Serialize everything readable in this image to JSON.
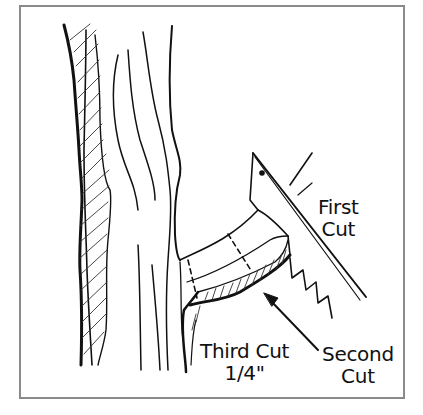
{
  "figure": {
    "frame_color": "#8a8a8a",
    "ink_color": "#111111",
    "labels": {
      "first_cut_line1": "First",
      "first_cut_line2": "Cut",
      "second_cut_line1": "Second",
      "second_cut_line2": "Cut",
      "third_cut_line1": "Third Cut",
      "third_cut_line2": "1/4\""
    },
    "elements": [
      "tree-trunk",
      "branch",
      "pruning-saw",
      "cut-arrow"
    ]
  }
}
